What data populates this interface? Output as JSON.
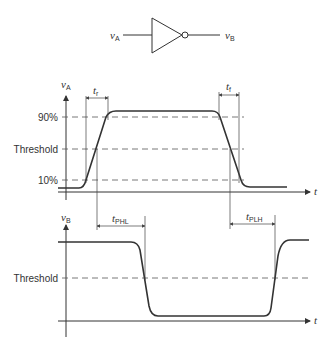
{
  "gate": {
    "type": "inverter",
    "input_label": "v",
    "input_sub": "A",
    "output_label": "v",
    "output_sub": "B"
  },
  "top_plot": {
    "y_axis_label": "v",
    "y_axis_sub": "A",
    "x_axis_label": "t",
    "levels": [
      "90%",
      "Threshold",
      "10%"
    ],
    "rise_time_label": "t",
    "rise_time_sub": "r",
    "fall_time_label": "t",
    "fall_time_sub": "f"
  },
  "bottom_plot": {
    "y_axis_label": "v",
    "y_axis_sub": "B",
    "x_axis_label": "t",
    "levels": [
      "Threshold"
    ],
    "tphl_label": "t",
    "tphl_sub": "PHL",
    "tplh_label": "t",
    "tplh_sub": "PLH"
  },
  "colors": {
    "stroke": "#333333",
    "background": "#ffffff"
  }
}
